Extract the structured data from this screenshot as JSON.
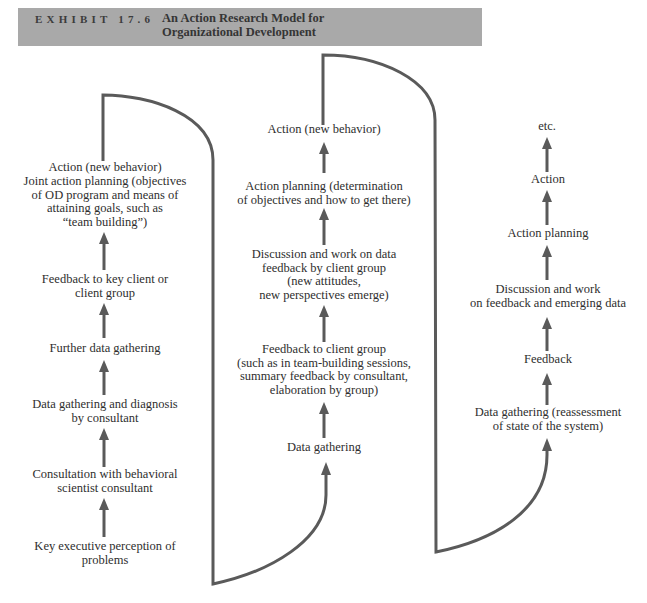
{
  "header": {
    "exhibit_label": "EXHIBIT 17.6",
    "title_line1": "An Action Research Model for",
    "title_line2": "Organizational Development"
  },
  "colors": {
    "header_background": "#a9a9a9",
    "line_color": "#5a5a5a",
    "text_color": "#2e2e2e"
  },
  "columns": [
    {
      "name": "initial-cycle",
      "steps": [
        {
          "lines": [
            "Key executive perception of",
            "problems"
          ]
        },
        {
          "lines": [
            "Consultation with behavioral",
            "scientist consultant"
          ]
        },
        {
          "lines": [
            "Data gathering and diagnosis",
            "by consultant"
          ]
        },
        {
          "lines": [
            "Further data gathering"
          ]
        },
        {
          "lines": [
            "Feedback to key client or",
            "client group"
          ]
        },
        {
          "lines": [
            "Joint action planning (objectives",
            "of OD program and means of",
            "attaining goals, such as",
            "“team building”)"
          ]
        },
        {
          "lines": [
            "Action (new behavior)"
          ]
        }
      ]
    },
    {
      "name": "second-cycle",
      "steps": [
        {
          "lines": [
            "Data gathering"
          ]
        },
        {
          "lines": [
            "Feedback to client group",
            "(such as in team-building sessions,",
            "summary feedback by consultant,",
            "elaboration by group)"
          ]
        },
        {
          "lines": [
            "Discussion and work on data",
            "feedback by client group",
            "(new attitudes,",
            "new perspectives emerge)"
          ]
        },
        {
          "lines": [
            "Action planning (determination",
            "of objectives and how to get there)"
          ]
        },
        {
          "lines": [
            "Action (new behavior)"
          ]
        }
      ]
    },
    {
      "name": "third-cycle",
      "steps": [
        {
          "lines": [
            "Data gathering (reassessment",
            "of state of the system)"
          ]
        },
        {
          "lines": [
            "Feedback"
          ]
        },
        {
          "lines": [
            "Discussion and work",
            "on feedback and emerging data"
          ]
        },
        {
          "lines": [
            "Action planning"
          ]
        },
        {
          "lines": [
            "Action"
          ]
        },
        {
          "lines": [
            "etc."
          ]
        }
      ]
    }
  ]
}
